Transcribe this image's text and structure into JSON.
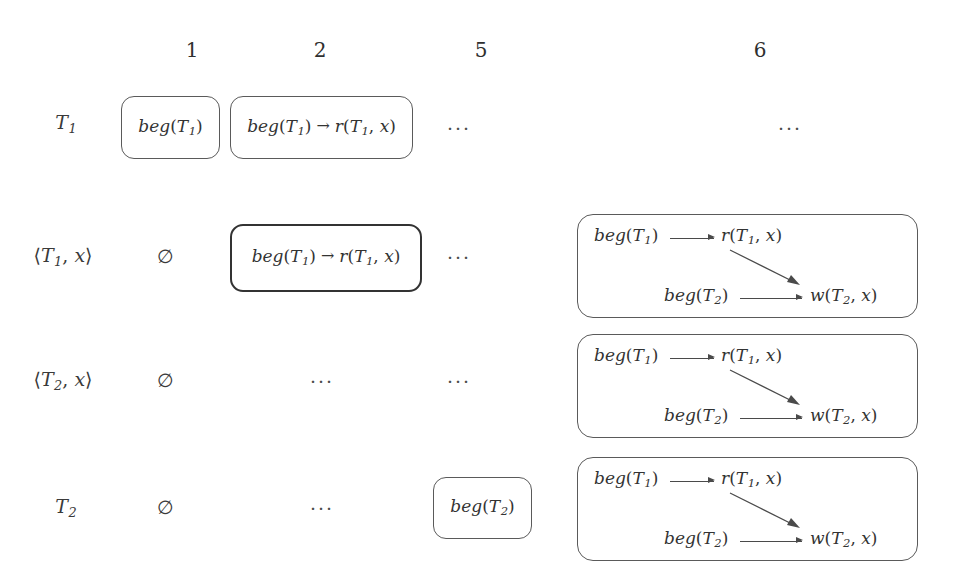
{
  "figure": {
    "type": "state-table",
    "background": "#ffffff",
    "ink": "#333333",
    "columns": [
      {
        "id": "c1",
        "label": "1"
      },
      {
        "id": "c2",
        "label": "2"
      },
      {
        "id": "c5",
        "label": "5"
      },
      {
        "id": "c6",
        "label": "6"
      }
    ],
    "rows": [
      {
        "id": "r1",
        "label_prefix": "T",
        "label_sub": "1",
        "label_text": "T1"
      },
      {
        "id": "r2",
        "label_prefix": "⟨T",
        "label_sub": "1",
        "label_suffix": ", x⟩",
        "label_text": "⟨T1, x⟩"
      },
      {
        "id": "r3",
        "label_prefix": "⟨T",
        "label_sub": "2",
        "label_suffix": ", x⟩",
        "label_text": "⟨T2, x⟩"
      },
      {
        "id": "r4",
        "label_prefix": "T",
        "label_sub": "2",
        "label_text": "T2"
      }
    ],
    "glyphs": {
      "emptyset": "∅",
      "ellipsis": "···",
      "short_arrow": "→",
      "angle_open": "⟨",
      "angle_close": "⟩"
    },
    "terms": {
      "beg": "beg",
      "read": "r",
      "write": "w",
      "var_x": "x",
      "lparen": "(",
      "rparen": ")",
      "comma": ",",
      "T": "T",
      "one": "1",
      "two": "2"
    },
    "cells": {
      "r1c1": {
        "kind": "box",
        "border": "thin",
        "content": "beg(T1)"
      },
      "r1c2": {
        "kind": "box",
        "border": "thin",
        "content": "beg(T1) → r(T1, x)"
      },
      "r1c5": {
        "kind": "ellipsis",
        "content": "···"
      },
      "r1c6": {
        "kind": "ellipsis",
        "content": "···"
      },
      "r2c1": {
        "kind": "emptyset",
        "content": "∅"
      },
      "r2c2": {
        "kind": "box",
        "border": "thick",
        "content": "beg(T1) → r(T1, x)"
      },
      "r2c5": {
        "kind": "ellipsis",
        "content": "···"
      },
      "r2c6": {
        "kind": "graph"
      },
      "r3c1": {
        "kind": "emptyset",
        "content": "∅"
      },
      "r3c2": {
        "kind": "ellipsis",
        "content": "···"
      },
      "r3c5": {
        "kind": "ellipsis",
        "content": "···"
      },
      "r3c6": {
        "kind": "graph"
      },
      "r4c1": {
        "kind": "emptyset",
        "content": "∅"
      },
      "r4c2": {
        "kind": "ellipsis",
        "content": "···"
      },
      "r4c5": {
        "kind": "box",
        "border": "thin",
        "content": "beg(T2)"
      },
      "r4c6": {
        "kind": "graph"
      }
    },
    "graph": {
      "nodes": [
        {
          "id": "n1",
          "text": "beg(T1)",
          "role": "begin-t1"
        },
        {
          "id": "n2",
          "text": "r(T1, x)",
          "role": "read-t1-x"
        },
        {
          "id": "n3",
          "text": "beg(T2)",
          "role": "begin-t2"
        },
        {
          "id": "n4",
          "text": "w(T2, x)",
          "role": "write-t2-x"
        }
      ],
      "edges": [
        {
          "from": "n1",
          "to": "n2",
          "style": "horizontal"
        },
        {
          "from": "n3",
          "to": "n4",
          "style": "horizontal"
        },
        {
          "from": "n2",
          "to": "n4",
          "style": "diagonal"
        }
      ]
    }
  }
}
